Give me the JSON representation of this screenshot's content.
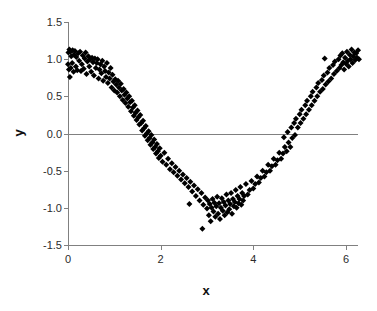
{
  "chart_data": {
    "type": "scatter",
    "title": "",
    "xlabel": "x",
    "ylabel": "y",
    "xlim": [
      0,
      6.2832
    ],
    "ylim": [
      -1.5,
      1.5
    ],
    "xticks": [
      0,
      2,
      4,
      6
    ],
    "yticks": [
      1.5,
      1.0,
      0.5,
      0.0,
      -0.5,
      -1.0,
      -1.5
    ],
    "xtick_labels": [
      "0",
      "2",
      "4",
      "6"
    ],
    "ytick_labels": [
      "1.5",
      "1.0",
      "0.5",
      "0.0",
      "-0.5",
      "-1.0",
      "-1.5"
    ],
    "grid": false,
    "legend": "none",
    "marker": "diamond",
    "marker_color": "#000000",
    "marker_size": 3,
    "axis_color": "#808080",
    "zero_line": 0.0,
    "series": [
      {
        "name": "y vs x",
        "points": [
          [
            0.0,
            0.93
          ],
          [
            0.01,
            1.09
          ],
          [
            0.02,
            0.86
          ],
          [
            0.03,
            1.13
          ],
          [
            0.04,
            0.76
          ],
          [
            0.05,
            1.1
          ],
          [
            0.06,
            0.88
          ],
          [
            0.07,
            1.04
          ],
          [
            0.09,
            0.95
          ],
          [
            0.1,
            1.12
          ],
          [
            0.12,
            0.83
          ],
          [
            0.13,
            1.06
          ],
          [
            0.15,
            1.11
          ],
          [
            0.17,
            0.9
          ],
          [
            0.18,
            1.03
          ],
          [
            0.2,
            0.85
          ],
          [
            0.22,
            1.08
          ],
          [
            0.24,
            0.98
          ],
          [
            0.26,
            1.1
          ],
          [
            0.28,
            0.84
          ],
          [
            0.3,
            0.93
          ],
          [
            0.32,
            1.05
          ],
          [
            0.34,
            0.87
          ],
          [
            0.36,
            1.01
          ],
          [
            0.38,
            1.09
          ],
          [
            0.4,
            0.8
          ],
          [
            0.42,
            0.97
          ],
          [
            0.44,
            1.04
          ],
          [
            0.46,
            0.9
          ],
          [
            0.48,
            1.0
          ],
          [
            0.5,
            0.83
          ],
          [
            0.52,
            1.02
          ],
          [
            0.54,
            0.96
          ],
          [
            0.56,
            0.78
          ],
          [
            0.58,
            1.01
          ],
          [
            0.6,
            0.88
          ],
          [
            0.62,
            0.95
          ],
          [
            0.64,
            1.0
          ],
          [
            0.66,
            0.74
          ],
          [
            0.68,
            0.86
          ],
          [
            0.7,
            0.93
          ],
          [
            0.72,
            0.81
          ],
          [
            0.74,
            0.98
          ],
          [
            0.76,
            0.71
          ],
          [
            0.78,
            0.9
          ],
          [
            0.8,
            0.84
          ],
          [
            0.82,
            0.76
          ],
          [
            0.84,
            0.95
          ],
          [
            0.86,
            0.68
          ],
          [
            0.88,
            0.82
          ],
          [
            0.9,
            0.74
          ],
          [
            0.92,
            0.88
          ],
          [
            0.94,
            0.62
          ],
          [
            0.96,
            0.79
          ],
          [
            0.98,
            0.7
          ],
          [
            1.0,
            0.58
          ],
          [
            1.02,
            0.73
          ],
          [
            1.04,
            0.66
          ],
          [
            1.06,
            0.55
          ],
          [
            1.08,
            0.71
          ],
          [
            1.1,
            0.62
          ],
          [
            1.12,
            0.5
          ],
          [
            1.14,
            0.67
          ],
          [
            1.16,
            0.58
          ],
          [
            1.18,
            0.45
          ],
          [
            1.2,
            0.6
          ],
          [
            1.22,
            0.52
          ],
          [
            1.24,
            0.41
          ],
          [
            1.26,
            0.55
          ],
          [
            1.28,
            0.47
          ],
          [
            1.3,
            0.36
          ],
          [
            1.32,
            0.5
          ],
          [
            1.34,
            0.42
          ],
          [
            1.36,
            0.3
          ],
          [
            1.38,
            0.44
          ],
          [
            1.4,
            0.35
          ],
          [
            1.42,
            0.24
          ],
          [
            1.44,
            0.38
          ],
          [
            1.46,
            0.28
          ],
          [
            1.48,
            0.18
          ],
          [
            1.5,
            0.31
          ],
          [
            1.52,
            0.22
          ],
          [
            1.54,
            0.12
          ],
          [
            1.56,
            0.25
          ],
          [
            1.58,
            0.14
          ],
          [
            1.6,
            0.04
          ],
          [
            1.62,
            0.17
          ],
          [
            1.64,
            0.07
          ],
          [
            1.66,
            -0.03
          ],
          [
            1.68,
            0.1
          ],
          [
            1.7,
            0.0
          ],
          [
            1.72,
            -0.09
          ],
          [
            1.74,
            0.03
          ],
          [
            1.76,
            -0.06
          ],
          [
            1.78,
            -0.15
          ],
          [
            1.8,
            -0.02
          ],
          [
            1.82,
            -0.12
          ],
          [
            1.84,
            -0.21
          ],
          [
            1.86,
            -0.08
          ],
          [
            1.88,
            -0.18
          ],
          [
            1.9,
            -0.27
          ],
          [
            1.92,
            -0.14
          ],
          [
            1.94,
            -0.24
          ],
          [
            1.96,
            -0.33
          ],
          [
            1.98,
            -0.2
          ],
          [
            2.0,
            -0.3
          ],
          [
            2.04,
            -0.38
          ],
          [
            2.08,
            -0.26
          ],
          [
            2.12,
            -0.42
          ],
          [
            2.16,
            -0.34
          ],
          [
            2.2,
            -0.48
          ],
          [
            2.24,
            -0.4
          ],
          [
            2.28,
            -0.52
          ],
          [
            2.32,
            -0.45
          ],
          [
            2.36,
            -0.57
          ],
          [
            2.4,
            -0.5
          ],
          [
            2.44,
            -0.62
          ],
          [
            2.48,
            -0.55
          ],
          [
            2.52,
            -0.67
          ],
          [
            2.56,
            -0.6
          ],
          [
            2.6,
            -0.72
          ],
          [
            2.62,
            -0.95
          ],
          [
            2.64,
            -0.65
          ],
          [
            2.68,
            -0.78
          ],
          [
            2.72,
            -0.7
          ],
          [
            2.76,
            -0.84
          ],
          [
            2.8,
            -0.75
          ],
          [
            2.84,
            -0.9
          ],
          [
            2.88,
            -0.8
          ],
          [
            2.9,
            -1.28
          ],
          [
            2.92,
            -0.96
          ],
          [
            2.96,
            -0.86
          ],
          [
            3.0,
            -1.01
          ],
          [
            3.02,
            -0.9
          ],
          [
            3.04,
            -1.1
          ],
          [
            3.06,
            -0.95
          ],
          [
            3.08,
            -1.18
          ],
          [
            3.1,
            -1.0
          ],
          [
            3.12,
            -0.88
          ],
          [
            3.14,
            -1.05
          ],
          [
            3.16,
            -0.93
          ],
          [
            3.18,
            -1.12
          ],
          [
            3.2,
            -0.98
          ],
          [
            3.22,
            -0.85
          ],
          [
            3.24,
            -1.08
          ],
          [
            3.26,
            -0.94
          ],
          [
            3.28,
            -1.15
          ],
          [
            3.3,
            -1.0
          ],
          [
            3.32,
            -0.87
          ],
          [
            3.34,
            -1.04
          ],
          [
            3.36,
            -0.92
          ],
          [
            3.38,
            -1.1
          ],
          [
            3.4,
            -0.97
          ],
          [
            3.42,
            -0.82
          ],
          [
            3.44,
            -1.06
          ],
          [
            3.46,
            -0.9
          ],
          [
            3.48,
            -1.02
          ],
          [
            3.5,
            -0.95
          ],
          [
            3.52,
            -0.8
          ],
          [
            3.54,
            -1.08
          ],
          [
            3.56,
            -0.88
          ],
          [
            3.58,
            -0.98
          ],
          [
            3.6,
            -0.92
          ],
          [
            3.62,
            -0.76
          ],
          [
            3.64,
            -1.0
          ],
          [
            3.66,
            -0.84
          ],
          [
            3.68,
            -0.94
          ],
          [
            3.7,
            -0.88
          ],
          [
            3.72,
            -0.72
          ],
          [
            3.74,
            -0.96
          ],
          [
            3.76,
            -0.8
          ],
          [
            3.78,
            -0.9
          ],
          [
            3.8,
            -0.84
          ],
          [
            3.84,
            -0.68
          ],
          [
            3.88,
            -0.82
          ],
          [
            3.92,
            -0.76
          ],
          [
            3.96,
            -0.64
          ],
          [
            4.0,
            -0.74
          ],
          [
            4.04,
            -0.68
          ],
          [
            4.08,
            -0.58
          ],
          [
            4.12,
            -0.66
          ],
          [
            4.16,
            -0.6
          ],
          [
            4.2,
            -0.5
          ],
          [
            4.24,
            -0.58
          ],
          [
            4.28,
            -0.52
          ],
          [
            4.32,
            -0.42
          ],
          [
            4.36,
            -0.5
          ],
          [
            4.4,
            -0.44
          ],
          [
            4.44,
            -0.34
          ],
          [
            4.48,
            -0.42
          ],
          [
            4.52,
            -0.36
          ],
          [
            4.56,
            -0.26
          ],
          [
            4.6,
            -0.34
          ],
          [
            4.64,
            -0.27
          ],
          [
            4.66,
            -0.05
          ],
          [
            4.68,
            -0.18
          ],
          [
            4.72,
            -0.24
          ],
          [
            4.74,
            0.02
          ],
          [
            4.76,
            -0.12
          ],
          [
            4.8,
            -0.18
          ],
          [
            4.82,
            0.08
          ],
          [
            4.84,
            -0.06
          ],
          [
            4.88,
            0.14
          ],
          [
            4.9,
            -0.02
          ],
          [
            4.92,
            0.2
          ],
          [
            4.96,
            0.08
          ],
          [
            5.0,
            0.26
          ],
          [
            5.02,
            0.14
          ],
          [
            5.04,
            0.32
          ],
          [
            5.08,
            0.2
          ],
          [
            5.12,
            0.38
          ],
          [
            5.14,
            0.26
          ],
          [
            5.16,
            0.44
          ],
          [
            5.2,
            0.32
          ],
          [
            5.24,
            0.5
          ],
          [
            5.26,
            0.38
          ],
          [
            5.28,
            0.56
          ],
          [
            5.32,
            0.44
          ],
          [
            5.36,
            0.62
          ],
          [
            5.38,
            0.5
          ],
          [
            5.4,
            0.68
          ],
          [
            5.44,
            0.56
          ],
          [
            5.48,
            0.72
          ],
          [
            5.5,
            0.6
          ],
          [
            5.52,
            0.78
          ],
          [
            5.54,
            1.01
          ],
          [
            5.56,
            0.66
          ],
          [
            5.6,
            0.82
          ],
          [
            5.62,
            0.7
          ],
          [
            5.64,
            0.88
          ],
          [
            5.68,
            0.74
          ],
          [
            5.72,
            0.92
          ],
          [
            5.74,
            0.8
          ],
          [
            5.76,
            0.97
          ],
          [
            5.8,
            0.84
          ],
          [
            5.84,
            1.0
          ],
          [
            5.86,
            0.88
          ],
          [
            5.88,
            1.05
          ],
          [
            5.9,
            0.92
          ],
          [
            5.92,
            1.08
          ],
          [
            5.94,
            0.96
          ],
          [
            5.96,
            0.86
          ],
          [
            5.98,
            1.02
          ],
          [
            6.0,
            0.94
          ],
          [
            6.02,
            1.1
          ],
          [
            6.04,
            0.98
          ],
          [
            6.06,
            0.9
          ],
          [
            6.08,
            1.06
          ],
          [
            6.1,
            1.0
          ],
          [
            6.12,
            1.13
          ],
          [
            6.14,
            0.95
          ],
          [
            6.16,
            1.04
          ],
          [
            6.18,
            1.09
          ],
          [
            6.2,
            0.99
          ],
          [
            6.22,
            1.08
          ],
          [
            6.24,
            1.02
          ],
          [
            6.26,
            1.12
          ],
          [
            6.28,
            1.0
          ]
        ]
      }
    ]
  },
  "axes": {
    "x_title": "x",
    "y_title": "y"
  }
}
